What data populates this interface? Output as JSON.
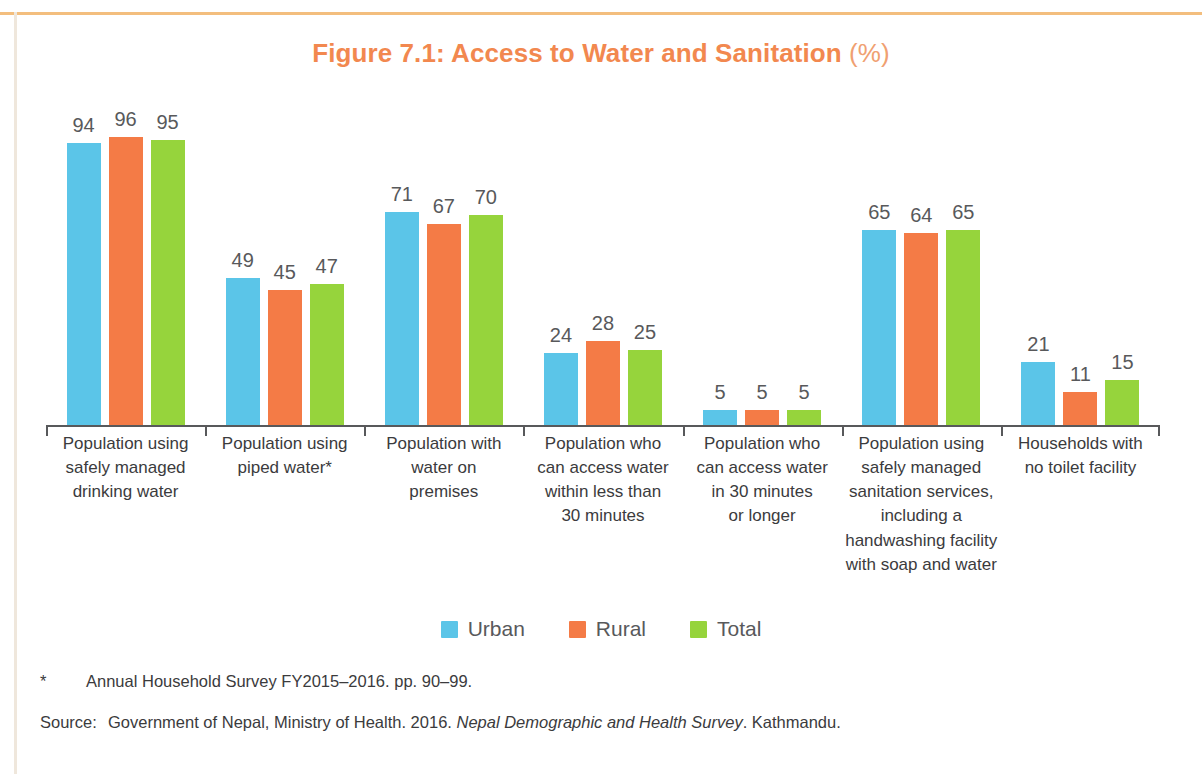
{
  "figure": {
    "title_main": "Figure 7.1: Access to Water and Sanitation",
    "title_unit": "(%)",
    "title_color": "#F2884F"
  },
  "legend": {
    "position": "bottom-center",
    "items": [
      {
        "label": "Urban",
        "color": "#5BC5E8"
      },
      {
        "label": "Rural",
        "color": "#F47B46"
      },
      {
        "label": "Total",
        "color": "#96D43C"
      }
    ]
  },
  "notes": {
    "footnote_marker": "*",
    "footnote_text": "Annual Household Survey FY2015–2016. pp. 90–99.",
    "source_label": "Source:",
    "source_prefix": "Government of Nepal, Ministry of Health. 2016. ",
    "source_title_italic": "Nepal Demographic and Health Survey",
    "source_suffix": ". Kathmandu."
  },
  "chart_data": {
    "type": "bar",
    "title": "Figure 7.1: Access to Water and Sanitation (%)",
    "xlabel": "",
    "ylabel": "",
    "ylim": [
      0,
      100
    ],
    "grid": false,
    "legend_position": "bottom-center",
    "categories": [
      "Population using safely managed drinking water",
      "Population using piped water*",
      "Population with water on premises",
      "Population who can access water within less than 30 minutes",
      "Population who can access water in 30 minutes or longer",
      "Population using safely managed sanitation services, including a handwashing facility with soap and water",
      "Households with no toilet facility"
    ],
    "category_lines": [
      [
        "Population using",
        "safely managed",
        "drinking water"
      ],
      [
        "Population using",
        "piped water*"
      ],
      [
        "Population with",
        "water on",
        "premises"
      ],
      [
        "Population who",
        "can access water",
        "within less than",
        "30 minutes"
      ],
      [
        "Population who",
        "can access water",
        "in 30 minutes",
        "or longer"
      ],
      [
        "Population using",
        "safely managed",
        "sanitation services,",
        "including a",
        "handwashing facility",
        "with soap and water"
      ],
      [
        "Households with",
        "no toilet facility"
      ]
    ],
    "series": [
      {
        "name": "Urban",
        "color": "#5BC5E8",
        "values": [
          94,
          49,
          71,
          24,
          5,
          65,
          21
        ]
      },
      {
        "name": "Rural",
        "color": "#F47B46",
        "values": [
          96,
          45,
          67,
          28,
          5,
          64,
          11
        ]
      },
      {
        "name": "Total",
        "color": "#96D43C",
        "values": [
          95,
          47,
          70,
          25,
          5,
          65,
          15
        ]
      }
    ]
  }
}
